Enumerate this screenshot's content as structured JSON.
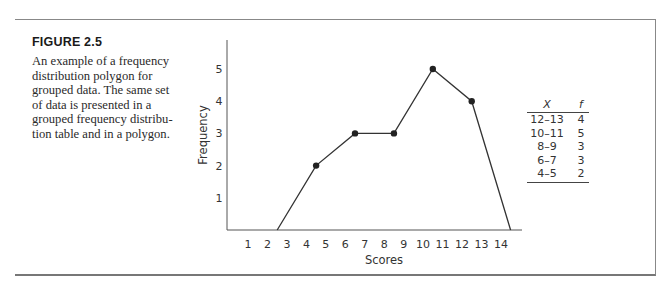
{
  "figure": {
    "label": "FIGURE 2.5",
    "caption": "An example of a frequency distribution polygon for grouped data. The same set of data is presented in a grouped frequency distribution table and in a polygon.",
    "caption_lines": [
      "An example of a frequency",
      "distribution polygon for",
      "grouped data. The same set",
      "of data is presented in a",
      "grouped frequency distribu-",
      "tion table and in a polygon."
    ]
  },
  "table": {
    "headers": [
      "X",
      "f"
    ],
    "rows": [
      {
        "x": "12–13",
        "f": "4"
      },
      {
        "x": "10–11",
        "f": "5"
      },
      {
        "x": "8–9",
        "f": "3"
      },
      {
        "x": "6–7",
        "f": "3"
      },
      {
        "x": "4–5",
        "f": "2"
      }
    ]
  },
  "chart_data": {
    "type": "line",
    "title": "",
    "xlabel": "Scores",
    "ylabel": "Frequency",
    "x_ticks": [
      "1",
      "2",
      "3",
      "4",
      "5",
      "6",
      "7",
      "8",
      "9",
      "10",
      "11",
      "12",
      "13",
      "14"
    ],
    "y_ticks": [
      "1",
      "2",
      "3",
      "4",
      "5"
    ],
    "xlim": [
      0,
      15
    ],
    "ylim": [
      0,
      6
    ],
    "grid": false,
    "legend": null,
    "series": [
      {
        "name": "Frequency polygon",
        "x": [
          2.5,
          4.5,
          6.5,
          8.5,
          10.5,
          12.5,
          14.5
        ],
        "y": [
          0,
          2,
          3,
          3,
          5,
          4,
          0
        ],
        "markers": [
          false,
          true,
          true,
          true,
          true,
          true,
          false
        ]
      }
    ],
    "class_intervals": [
      "4–5",
      "6–7",
      "8–9",
      "10–11",
      "12–13"
    ],
    "frequencies": [
      2,
      3,
      3,
      5,
      4
    ]
  }
}
